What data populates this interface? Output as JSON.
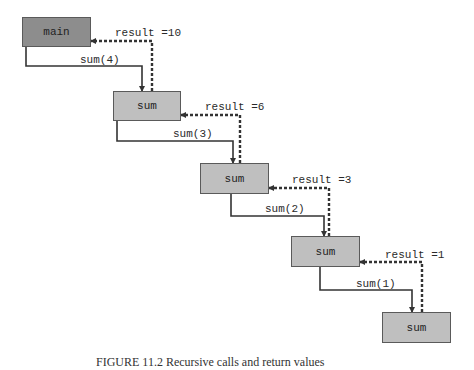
{
  "diagram": {
    "nodes": [
      {
        "id": "main",
        "label": "main",
        "kind": "main"
      },
      {
        "id": "sum1",
        "label": "sum",
        "kind": "sum"
      },
      {
        "id": "sum2",
        "label": "sum",
        "kind": "sum"
      },
      {
        "id": "sum3",
        "label": "sum",
        "kind": "sum"
      },
      {
        "id": "sum4",
        "label": "sum",
        "kind": "sum"
      }
    ],
    "calls": [
      {
        "from": "main",
        "to": "sum1",
        "label": "sum(4)"
      },
      {
        "from": "sum1",
        "to": "sum2",
        "label": "sum(3)"
      },
      {
        "from": "sum2",
        "to": "sum3",
        "label": "sum(2)"
      },
      {
        "from": "sum3",
        "to": "sum4",
        "label": "sum(1)"
      }
    ],
    "returns": [
      {
        "from": "sum1",
        "to": "main",
        "label": "result =10"
      },
      {
        "from": "sum2",
        "to": "sum1",
        "label": "result =6"
      },
      {
        "from": "sum3",
        "to": "sum2",
        "label": "result =3"
      },
      {
        "from": "sum4",
        "to": "sum3",
        "label": "result =1"
      }
    ],
    "colors": {
      "main_fill": "#8d8d8d",
      "sum_fill": "#bfbfbf",
      "line": "#333333"
    }
  },
  "caption": "FIGURE 11.2  Recursive calls and return values"
}
